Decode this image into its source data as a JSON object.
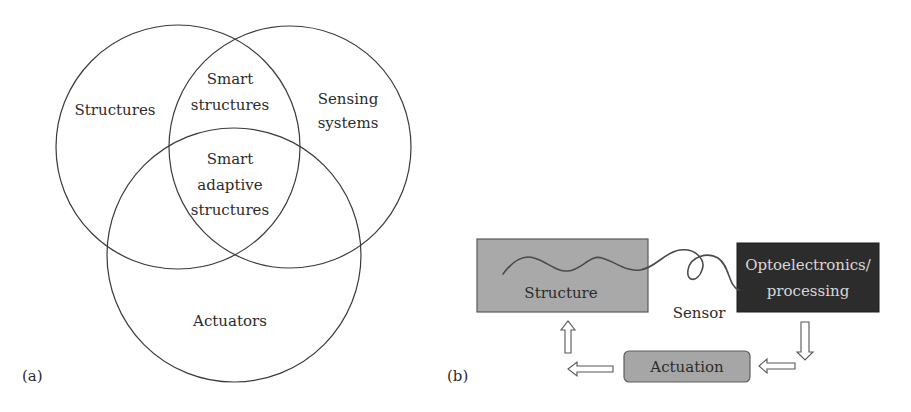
{
  "panel_a": {
    "label": "(a)",
    "sets": {
      "left": "Structures",
      "right_line1": "Sensing",
      "right_line2": "systems",
      "bottom": "Actuators"
    },
    "intersections": {
      "top_line1": "Smart",
      "top_line2": "structures",
      "center_line1": "Smart",
      "center_line2": "adaptive",
      "center_line3": "structures"
    }
  },
  "panel_b": {
    "label": "(b)",
    "structure_box": "Structure",
    "sensor_label": "Sensor",
    "processing_line1": "Optoelectronics/",
    "processing_line2": "processing",
    "actuation_box": "Actuation",
    "colors": {
      "structure_fill": "#a9a9a9",
      "processing_fill": "#2c2c2c",
      "actuation_fill": "#a6a6a6"
    }
  }
}
